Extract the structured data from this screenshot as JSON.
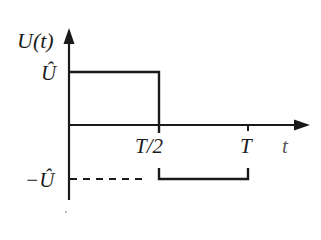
{
  "diagram": {
    "type": "square-wave voltage plot",
    "axis_y_label": "U(t)",
    "axis_x_label": "t",
    "level_high_label": "Û",
    "level_low_label": "−Û",
    "tick_half_period_label": "T/2",
    "tick_period_label": "T",
    "colors": {
      "line": "#1a1a1a",
      "background": "#ffffff"
    },
    "segments": [
      {
        "from": "0",
        "to": "T/2",
        "level": "Û"
      },
      {
        "from": "T/2",
        "to": "T",
        "level": "−Û"
      }
    ]
  }
}
